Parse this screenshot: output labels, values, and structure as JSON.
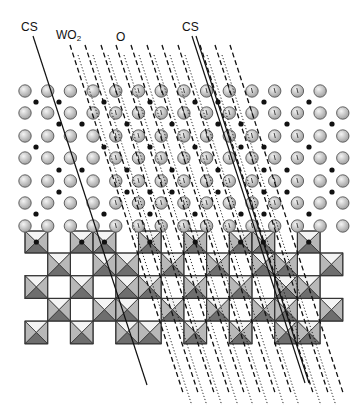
{
  "figure": {
    "labels": [
      {
        "id": "cs-left",
        "text": "CS",
        "x": 21,
        "y": 21
      },
      {
        "id": "wo2",
        "text": "WO",
        "sub": "2",
        "x": 56,
        "y": 29
      },
      {
        "id": "o",
        "text": "O",
        "x": 116,
        "y": 31
      },
      {
        "id": "cs-right",
        "text": "CS",
        "x": 182,
        "y": 21
      }
    ]
  },
  "colors": {
    "oxygen_fill_light": "#eeeeee",
    "oxygen_fill_dark": "#a9a9a9",
    "oxygen_stroke": "#555555",
    "metal_dot": "#111111",
    "tri_top": "#f4f4f4",
    "tri_side": "#b8b8b8",
    "tri_bottom": "#6e6e6e",
    "edge": "#333333",
    "line": "#111111"
  },
  "grid": {
    "x0": 25,
    "dx": 22.7,
    "r": 6.2,
    "rows": [
      {
        "y": 91,
        "cols": [
          0,
          1,
          2,
          3,
          4,
          5,
          6,
          7,
          8,
          9,
          10,
          11,
          12,
          13
        ]
      },
      {
        "y": 113,
        "cols": [
          0,
          1,
          2,
          3,
          4,
          5,
          6,
          7,
          8,
          9,
          10,
          11,
          12,
          13,
          14
        ]
      },
      {
        "y": 136,
        "cols": [
          0,
          1,
          2,
          3,
          4,
          5,
          6,
          7,
          8,
          9,
          10,
          11,
          12,
          13,
          14
        ]
      },
      {
        "y": 158,
        "cols": [
          0,
          1,
          2,
          3,
          4,
          5,
          6,
          7,
          8,
          9,
          10,
          11,
          12,
          13,
          14
        ]
      },
      {
        "y": 181,
        "cols": [
          0,
          1,
          2,
          3,
          4,
          5,
          6,
          7,
          8,
          9,
          10,
          11,
          12,
          13,
          14
        ]
      },
      {
        "y": 203,
        "cols": [
          0,
          1,
          2,
          3,
          4,
          5,
          6,
          7,
          8,
          9,
          10,
          11,
          12,
          13,
          14
        ]
      },
      {
        "y": 226,
        "cols": [
          0,
          1,
          2,
          3,
          4,
          5,
          6,
          7,
          8,
          9,
          10,
          11,
          12,
          13,
          14
        ]
      }
    ],
    "marked_cols": [
      4,
      5,
      6,
      7,
      8,
      9,
      10,
      11,
      12
    ],
    "marked_rows": [
      0,
      1,
      2,
      3,
      4,
      5,
      6
    ]
  },
  "metal_dots": [
    {
      "y": 102,
      "xs": [
        36,
        59,
        104,
        150,
        195,
        218,
        264,
        309
      ]
    },
    {
      "y": 124,
      "xs": [
        59,
        82,
        127,
        172,
        218,
        241,
        287,
        332
      ]
    },
    {
      "y": 147,
      "xs": [
        36,
        104,
        150,
        195,
        241,
        264,
        309
      ]
    },
    {
      "y": 170,
      "xs": [
        59,
        82,
        127,
        172,
        218,
        264,
        287,
        332
      ]
    },
    {
      "y": 192,
      "xs": [
        59,
        127,
        150,
        172,
        218,
        264,
        287,
        332
      ]
    },
    {
      "y": 214,
      "xs": [
        36,
        104,
        150,
        195,
        241,
        264,
        309
      ]
    }
  ],
  "octahedra": {
    "size": 22.7,
    "half_row": {
      "y": 231,
      "h": 22,
      "cols": [
        0,
        2,
        3,
        5,
        7,
        9,
        10,
        12
      ]
    },
    "rows": [
      {
        "y": 253,
        "cols": [
          1,
          3,
          4,
          6,
          8,
          10,
          11,
          13
        ]
      },
      {
        "y": 275.7,
        "cols": [
          0,
          2,
          4,
          5,
          7,
          9,
          11,
          12
        ]
      },
      {
        "y": 298.4,
        "cols": [
          1,
          3,
          4,
          6,
          8,
          10,
          11,
          13
        ]
      },
      {
        "y": 321.1,
        "cols": [
          0,
          2,
          4,
          5,
          7,
          9,
          11,
          12
        ]
      }
    ]
  },
  "cs_lines": [
    {
      "id": "cs-left-line",
      "x1": 33,
      "y1": 36,
      "x2": 147,
      "y2": 385
    },
    {
      "id": "cs-right-line-a",
      "x1": 192,
      "y1": 36,
      "x2": 305,
      "y2": 383
    },
    {
      "id": "cs-right-line-b",
      "x1": 196,
      "y1": 36,
      "x2": 309,
      "y2": 383
    }
  ],
  "dashed_lines": {
    "dy": 350,
    "dx_per": 0.325,
    "starts": [
      {
        "x": 70,
        "y": 45
      },
      {
        "x": 85,
        "y": 45
      },
      {
        "x": 101,
        "y": 45
      },
      {
        "x": 116,
        "y": 45
      },
      {
        "x": 131,
        "y": 45
      },
      {
        "x": 147,
        "y": 45
      },
      {
        "x": 162,
        "y": 45
      },
      {
        "x": 178,
        "y": 45
      },
      {
        "x": 200,
        "y": 45
      },
      {
        "x": 215,
        "y": 45
      },
      {
        "x": 230,
        "y": 45
      }
    ]
  },
  "dotted_lines": {
    "dy": 350,
    "dx_per": 0.325,
    "starts": [
      {
        "x": 78,
        "y": 55
      },
      {
        "x": 93,
        "y": 55
      },
      {
        "x": 108,
        "y": 55
      },
      {
        "x": 124,
        "y": 55
      },
      {
        "x": 139,
        "y": 55
      },
      {
        "x": 154,
        "y": 55
      },
      {
        "x": 170,
        "y": 55
      },
      {
        "x": 185,
        "y": 55
      },
      {
        "x": 207,
        "y": 55
      },
      {
        "x": 222,
        "y": 55
      }
    ]
  }
}
